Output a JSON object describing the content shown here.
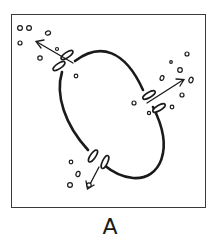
{
  "figure": {
    "panel_label": "A",
    "colors": {
      "stroke": "#1a1a1a",
      "frame": "#3a3a3a",
      "background": "#ffffff"
    },
    "channels": [
      {
        "name": "upper-left",
        "arrow_direction": "up-left"
      },
      {
        "name": "right",
        "arrow_direction": "up-right"
      },
      {
        "name": "bottom",
        "arrow_direction": "down-left"
      }
    ]
  }
}
